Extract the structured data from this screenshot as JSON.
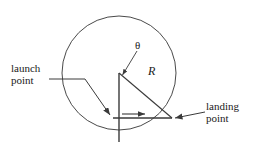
{
  "figure": {
    "kind": "projectile-on-circular-body-diagram",
    "labels": {
      "launch_line1": "launch",
      "launch_line2": "point",
      "landing_line1": "landing",
      "landing_line2": "point",
      "angle_symbol": "θ",
      "radius_symbol": "R"
    },
    "colors": {
      "stroke": "#3a3a3a",
      "text": "#1a1a1a",
      "background": "#ffffff"
    },
    "geometry": {
      "circle_center_x": 119,
      "circle_center_y": 73,
      "circle_radius": 57,
      "vertical_radius_bottom_x": 119,
      "vertical_radius_bottom_y": 142,
      "angle_vertex_x": 119,
      "angle_vertex_y": 73,
      "landing_point_x": 172,
      "landing_point_y": 118,
      "launch_point_x": 114,
      "launch_point_y": 118,
      "velocity_arrow_start_x": 122,
      "velocity_arrow_start_y": 114,
      "velocity_arrow_end_x": 147,
      "velocity_arrow_end_y": 114
    }
  }
}
